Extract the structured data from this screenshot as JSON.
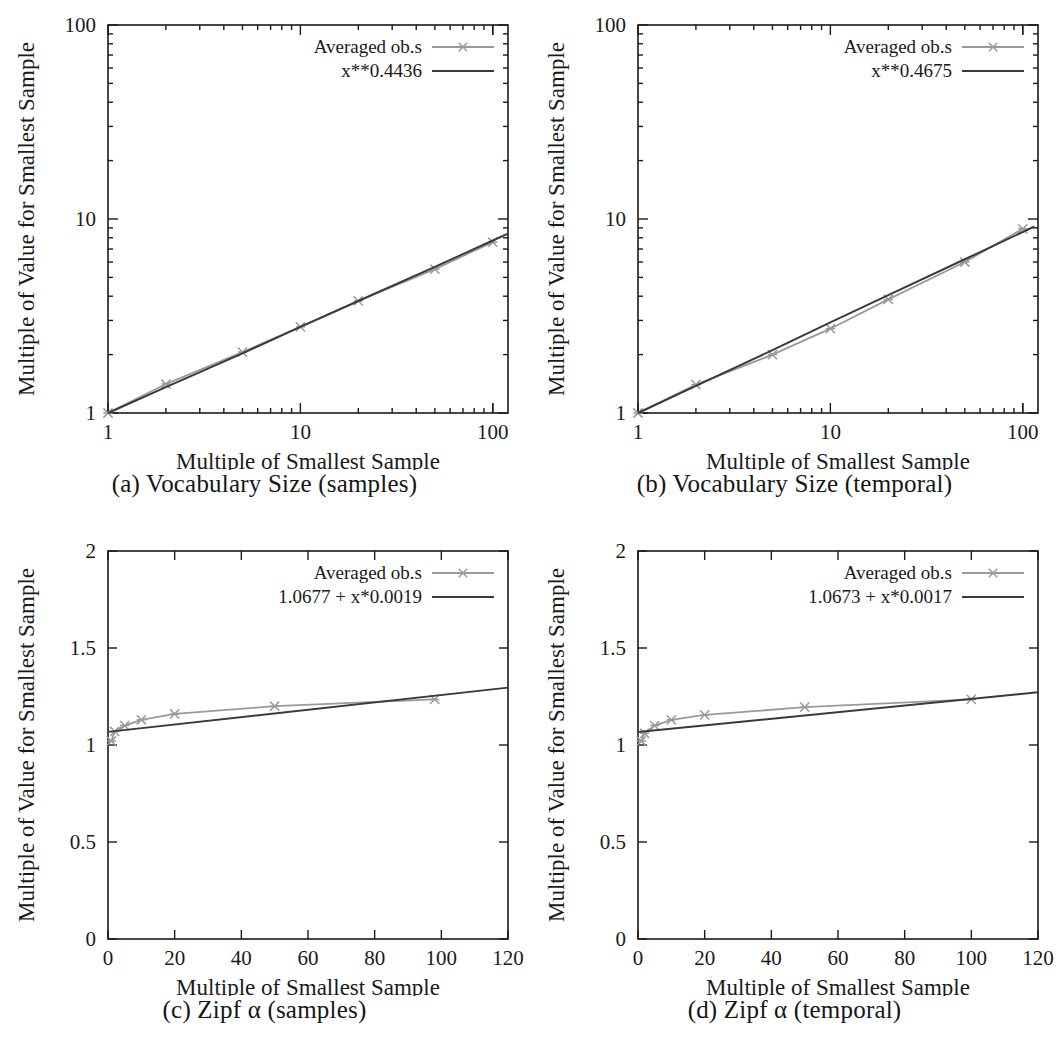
{
  "figure": {
    "panel_count": 4,
    "axis_label_x": "Multiple of Smallest Sample",
    "axis_label_y": "Multiple of Value for Smallest Sample",
    "series_label": "Averaged  ob.s",
    "colors": {
      "data": "#9a9a9a",
      "fit": "#3a3a3a",
      "axis": "#1a1a1a"
    }
  },
  "panels": [
    {
      "id": "a",
      "caption": "(a) Vocabulary Size (samples)",
      "fit_label": "x**0.4436",
      "series_label": "Averaged  ob.s",
      "xlabel": "Multiple of Smallest Sample",
      "ylabel": "Multiple of Value for Smallest Sample",
      "xticks": [
        "1",
        "10",
        "100"
      ],
      "yticks": [
        "1",
        "10",
        "100"
      ]
    },
    {
      "id": "b",
      "caption": "(b) Vocabulary Size (temporal)",
      "fit_label": "x**0.4675",
      "series_label": "Averaged ob.s",
      "xlabel": "Multiple of Smallest Sample",
      "ylabel": "Multiple of Value for Smallest Sample",
      "xticks": [
        "1",
        "10",
        "100"
      ],
      "yticks": [
        "1",
        "10",
        "100"
      ]
    },
    {
      "id": "c",
      "caption": "(c) Zipf α (samples)",
      "fit_label": "1.0677  + x*0.0019",
      "series_label": "Averaged  ob.s",
      "xlabel": "Multiple of Smallest Sample",
      "ylabel": "Multiple of Value for Smallest Sample",
      "xticks": [
        "0",
        "20",
        "40",
        "60",
        "80",
        "100",
        "120"
      ],
      "yticks": [
        "0",
        "0.5",
        "1",
        "1.5",
        "2"
      ]
    },
    {
      "id": "d",
      "caption": "(d) Zipf α (temporal)",
      "fit_label": "1.0673  + x*0.0017",
      "series_label": "Averaged  ob.s",
      "xlabel": "Multiple of Smallest Sample",
      "ylabel": "Multiple of Value for Smallest Sample",
      "xticks": [
        "0",
        "20",
        "40",
        "60",
        "80",
        "100",
        "120"
      ],
      "yticks": [
        "0",
        "0.5",
        "1",
        "1.5",
        "2"
      ]
    }
  ],
  "chart_data": [
    {
      "type": "line",
      "panel": "a",
      "title": "(a) Vocabulary Size (samples)",
      "xlabel": "Multiple of Smallest Sample",
      "ylabel": "Multiple of Value for Smallest Sample",
      "xscale": "log",
      "yscale": "log",
      "xlim": [
        1,
        120
      ],
      "ylim": [
        1,
        100
      ],
      "xticks": [
        1,
        10,
        100
      ],
      "yticks": [
        1,
        10,
        100
      ],
      "grid": false,
      "legend_position": "top-right",
      "series": [
        {
          "name": "Averaged  ob.s",
          "marker": "x",
          "color": "#9a9a9a",
          "x": [
            1,
            2,
            5,
            10,
            20,
            50,
            100
          ],
          "y": [
            1.0,
            1.41,
            2.06,
            2.78,
            3.78,
            5.52,
            7.59
          ]
        },
        {
          "name": "x**0.4436",
          "marker": "none",
          "color": "#3a3a3a",
          "x": [
            1,
            2,
            5,
            10,
            20,
            50,
            100,
            120
          ],
          "y": [
            1.0,
            1.36,
            2.03,
            2.78,
            3.78,
            5.66,
            7.75,
            8.41
          ]
        }
      ]
    },
    {
      "type": "line",
      "panel": "b",
      "title": "(b) Vocabulary Size (temporal)",
      "xlabel": "Multiple of Smallest Sample",
      "ylabel": "Multiple of Value for Smallest Sample",
      "xscale": "log",
      "yscale": "log",
      "xlim": [
        1,
        120
      ],
      "ylim": [
        1,
        100
      ],
      "xticks": [
        1,
        10,
        100
      ],
      "yticks": [
        1,
        10,
        100
      ],
      "grid": false,
      "legend_position": "top-right",
      "series": [
        {
          "name": "Averaged ob.s",
          "marker": "x",
          "color": "#9a9a9a",
          "x": [
            1,
            2,
            5,
            10,
            20,
            50,
            100
          ],
          "y": [
            1.0,
            1.4,
            2.0,
            2.72,
            3.85,
            6.0,
            8.9
          ]
        },
        {
          "name": "x**0.4675",
          "marker": "none",
          "color": "#3a3a3a",
          "x": [
            1,
            2,
            5,
            10,
            20,
            50,
            100,
            115
          ],
          "y": [
            1.0,
            1.38,
            2.11,
            2.93,
            4.05,
            6.2,
            8.57,
            9.15
          ]
        }
      ]
    },
    {
      "type": "line",
      "panel": "c",
      "title": "(c) Zipf α (samples)",
      "xlabel": "Multiple of Smallest Sample",
      "ylabel": "Multiple of Value for Smallest Sample",
      "xscale": "linear",
      "yscale": "linear",
      "xlim": [
        0,
        120
      ],
      "ylim": [
        0,
        2
      ],
      "xticks": [
        0,
        20,
        40,
        60,
        80,
        100,
        120
      ],
      "yticks": [
        0,
        0.5,
        1,
        1.5,
        2
      ],
      "grid": false,
      "legend_position": "top-right",
      "series": [
        {
          "name": "Averaged  ob.s",
          "marker": "x",
          "color": "#9a9a9a",
          "x": [
            1,
            2,
            5,
            10,
            20,
            50,
            98
          ],
          "y": [
            1.02,
            1.07,
            1.1,
            1.13,
            1.16,
            1.2,
            1.235
          ]
        },
        {
          "name": "1.0677  + x*0.0019",
          "marker": "none",
          "color": "#3a3a3a",
          "x": [
            0,
            120
          ],
          "y": [
            1.0677,
            1.2957
          ]
        }
      ]
    },
    {
      "type": "line",
      "panel": "d",
      "title": "(d) Zipf α (temporal)",
      "xlabel": "Multiple of Smallest Sample",
      "ylabel": "Multiple of Value for Smallest Sample",
      "xscale": "linear",
      "yscale": "linear",
      "xlim": [
        0,
        120
      ],
      "ylim": [
        0,
        2
      ],
      "xticks": [
        0,
        20,
        40,
        60,
        80,
        100,
        120
      ],
      "yticks": [
        0,
        0.5,
        1,
        1.5,
        2
      ],
      "grid": false,
      "legend_position": "top-right",
      "series": [
        {
          "name": "Averaged  ob.s",
          "marker": "x",
          "color": "#9a9a9a",
          "x": [
            1,
            2,
            5,
            10,
            20,
            50,
            100
          ],
          "y": [
            1.02,
            1.06,
            1.1,
            1.13,
            1.155,
            1.195,
            1.235
          ]
        },
        {
          "name": "1.0673  + x*0.0017",
          "marker": "none",
          "color": "#3a3a3a",
          "x": [
            0,
            120
          ],
          "y": [
            1.0673,
            1.2713
          ]
        }
      ]
    }
  ]
}
